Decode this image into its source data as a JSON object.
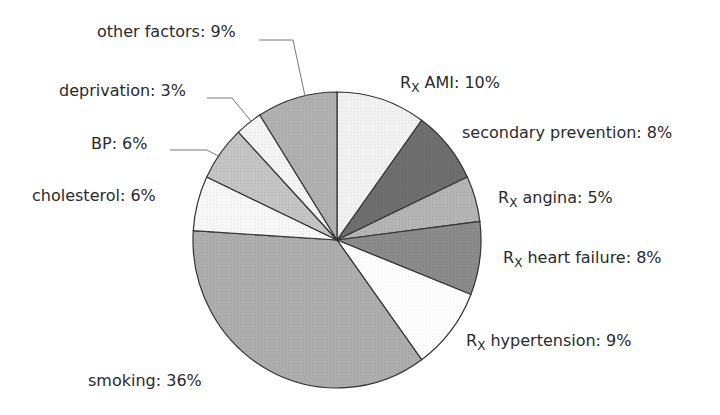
{
  "chart_data": {
    "type": "pie",
    "title": "",
    "start_angle": "12 o'clock",
    "direction": "clockwise",
    "slices": [
      {
        "label": "Rx AMI",
        "value": 10,
        "display": "AMI: 10%",
        "fill": "#f1f1f1"
      },
      {
        "label": "secondary prevention",
        "value": 8,
        "display": "secondary prevention: 8%",
        "fill": "#6e6e6e"
      },
      {
        "label": "Rx angina",
        "value": 5,
        "display": "angina: 5%",
        "fill": "#b4b4b4"
      },
      {
        "label": "Rx heart failure",
        "value": 8,
        "display": "heart failure: 8%",
        "fill": "#8a8a8a"
      },
      {
        "label": "Rx hypertension",
        "value": 9,
        "display": "hypertension: 9%",
        "fill": "#ffffff"
      },
      {
        "label": "smoking",
        "value": 36,
        "display": "smoking: 36%",
        "fill": "#adadad"
      },
      {
        "label": "cholesterol",
        "value": 6,
        "display": "cholesterol: 6%",
        "fill": "#f7f7f7"
      },
      {
        "label": "BP",
        "value": 6,
        "display": "BP: 6%",
        "fill": "#c4c4c4"
      },
      {
        "label": "deprivation",
        "value": 3,
        "display": "deprivation: 3%",
        "fill": "#f4f4f4"
      },
      {
        "label": "other factors",
        "value": 9,
        "display": "other factors: 9%",
        "fill": "#b0b0b0"
      }
    ],
    "rx_prefix": {
      "main": "R",
      "sub": "X"
    },
    "legend": "none (direct labels with leader lines)"
  },
  "labels": {
    "rx_main": "R",
    "rx_sub": "X",
    "ami": " AMI: 10%",
    "secondary": "secondary prevention: 8%",
    "angina": " angina: 5%",
    "heart_failure": " heart failure: 8%",
    "hypertension": " hypertension: 9%",
    "smoking": "smoking: 36%",
    "cholesterol": "cholesterol: 6%",
    "bp": "BP: 6%",
    "deprivation": "deprivation: 3%",
    "other": "other factors: 9%"
  }
}
